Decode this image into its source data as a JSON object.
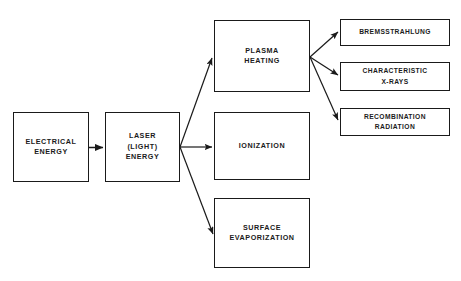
{
  "diagram": {
    "type": "flowchart",
    "background_color": "#ffffff",
    "line_color": "#1a1a1a",
    "text_color": "#1b1b1b",
    "nodes": [
      {
        "id": "electrical-energy",
        "label": "ELECTRICAL\nENERGY",
        "x": 13,
        "y": 112,
        "w": 76,
        "h": 70,
        "column": "input"
      },
      {
        "id": "laser-light-energy",
        "label": "LASER\n(LIGHT)\nENERGY",
        "x": 105,
        "y": 112,
        "w": 75,
        "h": 70,
        "column": "input"
      },
      {
        "id": "plasma-heating",
        "label": "PLASMA\nHEATING",
        "x": 214,
        "y": 20,
        "w": 96,
        "h": 72,
        "column": "process"
      },
      {
        "id": "ionization",
        "label": "IONIZATION",
        "x": 214,
        "y": 112,
        "w": 96,
        "h": 68,
        "column": "process"
      },
      {
        "id": "surface-evaporization",
        "label": "SURFACE\nEVAPORIZATION",
        "x": 214,
        "y": 198,
        "w": 96,
        "h": 70,
        "column": "process"
      },
      {
        "id": "bremsstrahlung",
        "label": "BREMSSTRAHLUNG",
        "x": 340,
        "y": 19,
        "w": 110,
        "h": 27,
        "column": "output"
      },
      {
        "id": "characteristic-x-rays",
        "label": "CHARACTERISTIC\nX-RAYS",
        "x": 340,
        "y": 62,
        "w": 110,
        "h": 29,
        "column": "output"
      },
      {
        "id": "recombination-radiation",
        "label": "RECOMBINATION\nRADIATION",
        "x": 340,
        "y": 108,
        "w": 110,
        "h": 28,
        "column": "output"
      }
    ],
    "edges": [
      {
        "id": "edge-electrical-to-laser",
        "from": "electrical-energy",
        "to": "laser-light-energy"
      },
      {
        "id": "edge-laser-to-plasma",
        "from": "laser-light-energy",
        "to": "plasma-heating"
      },
      {
        "id": "edge-laser-to-ionization",
        "from": "laser-light-energy",
        "to": "ionization"
      },
      {
        "id": "edge-laser-to-surface",
        "from": "laser-light-energy",
        "to": "surface-evaporization"
      },
      {
        "id": "edge-plasma-to-bremsstrahlung",
        "from": "plasma-heating",
        "to": "bremsstrahlung"
      },
      {
        "id": "edge-plasma-to-xrays",
        "from": "plasma-heating",
        "to": "characteristic-x-rays"
      },
      {
        "id": "edge-plasma-to-recombination",
        "from": "plasma-heating",
        "to": "recombination-radiation"
      }
    ]
  }
}
